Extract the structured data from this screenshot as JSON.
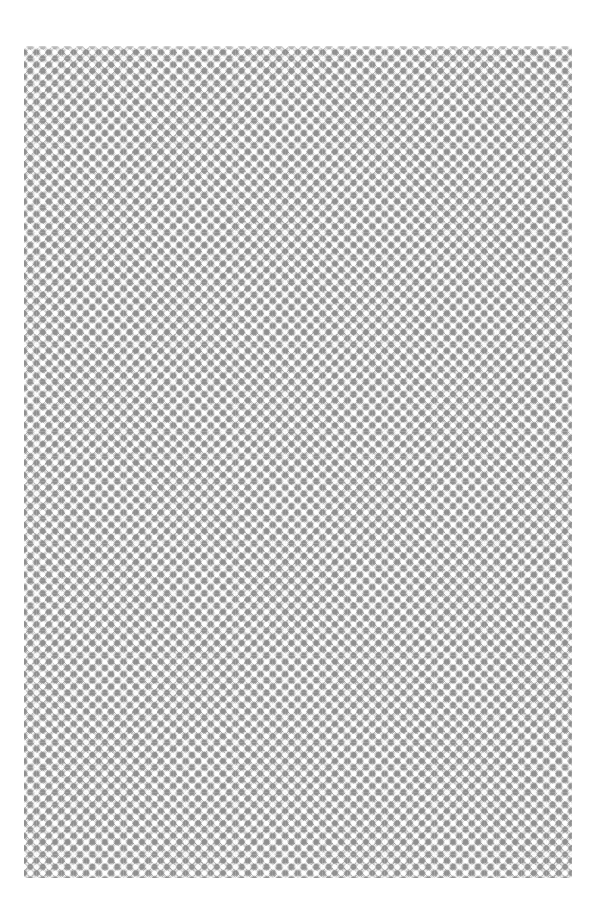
{
  "canvas": {
    "width": 599,
    "height": 921,
    "background": "#ffffff"
  },
  "pattern": {
    "name": "diagonal-diamond-lattice",
    "region": {
      "x": 24,
      "y": 46,
      "width": 548,
      "height": 832
    },
    "tile_size_px": 12.45,
    "colors": {
      "base": "#d4d4d4",
      "dark_diamonds": "#8f8f8f",
      "light_dots": "#ffffff"
    }
  }
}
